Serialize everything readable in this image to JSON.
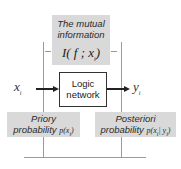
{
  "diagram": {
    "top_box": {
      "line1": "The mutual",
      "line2": "information",
      "formula_prefix": "I( f ; x",
      "formula_sub": "i",
      "formula_suffix": ")"
    },
    "center_box": {
      "line1": "Logic",
      "line2": "network"
    },
    "input_var": {
      "base": "x",
      "sub": "i"
    },
    "output_var": {
      "base": "y",
      "sub": "i"
    },
    "bottom_left_box": {
      "line1": "Priory",
      "line2_text": "probability ",
      "line2_expr_prefix": "p(x",
      "line2_expr_sub": "i",
      "line2_expr_suffix": ")"
    },
    "bottom_right_box": {
      "line1": "Posteriori",
      "line2_text": "probability ",
      "line2_expr_prefix": "p(x",
      "line2_expr_sub1": "i",
      "line2_expr_mid": "| y",
      "line2_expr_sub2": "i",
      "line2_expr_suffix": ")"
    },
    "colors": {
      "box_fill": "#d9d9d9",
      "line": "#9a9a9a",
      "arrow": "#222222"
    }
  }
}
